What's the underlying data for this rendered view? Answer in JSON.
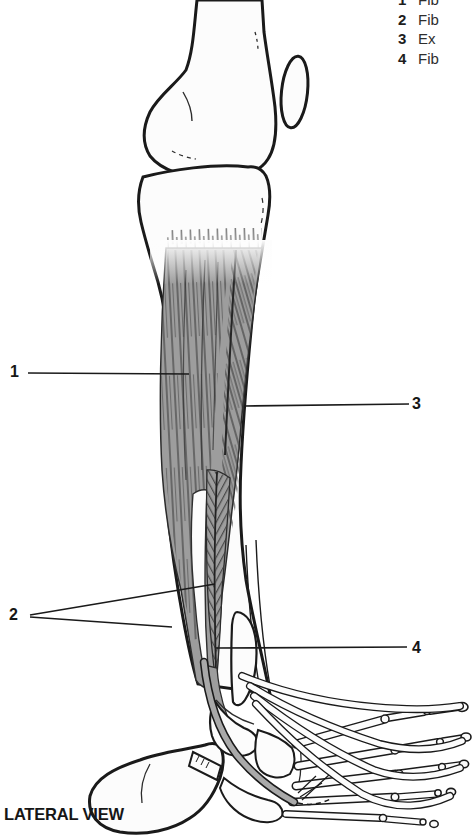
{
  "figure": {
    "caption": "LATERAL VIEW",
    "legend": {
      "items": [
        {
          "num": "1",
          "text": "Fib"
        },
        {
          "num": "2",
          "text": "Fib"
        },
        {
          "num": "3",
          "text": "Ex"
        },
        {
          "num": "4",
          "text": "Fib"
        }
      ]
    },
    "callouts": {
      "c1": "1",
      "c2": "2",
      "c3": "3",
      "c4": "4"
    },
    "colors": {
      "ink": "#1a1a1a",
      "muscle_gray": "#9d9d9d",
      "striation": "#3f3f3f",
      "bone": "#fcfcfc",
      "background": "#ffffff"
    }
  }
}
